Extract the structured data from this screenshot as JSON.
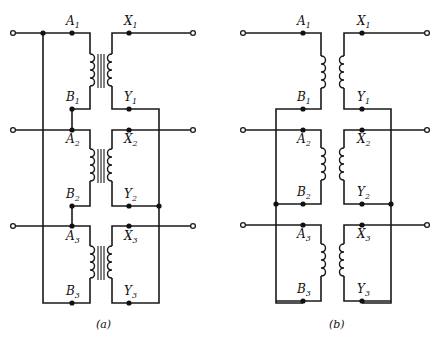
{
  "figure": {
    "panels": [
      {
        "id": "a",
        "caption": "(a)",
        "description": "Three single-phase transformers with iron cores; primaries and secondaries connected with cross bus wiring",
        "has_core": true,
        "rows": [
          {
            "primary_top": "A",
            "primary_bottom": "B",
            "secondary_top": "X",
            "secondary_bottom": "Y",
            "index": "1"
          },
          {
            "primary_top": "A",
            "primary_bottom": "B",
            "secondary_top": "X",
            "secondary_bottom": "Y",
            "index": "2"
          },
          {
            "primary_top": "A",
            "primary_bottom": "B",
            "secondary_top": "X",
            "secondary_bottom": "Y",
            "index": "3"
          }
        ]
      },
      {
        "id": "b",
        "caption": "(b)",
        "description": "Three transformer winding pairs without drawn core; primaries and secondaries connected via vertical buses",
        "has_core": false,
        "rows": [
          {
            "primary_top": "A",
            "primary_bottom": "B",
            "secondary_top": "X",
            "secondary_bottom": "Y",
            "index": "1"
          },
          {
            "primary_top": "A",
            "primary_bottom": "B",
            "secondary_top": "X",
            "secondary_bottom": "Y",
            "index": "2"
          },
          {
            "primary_top": "A",
            "primary_bottom": "B",
            "secondary_top": "X",
            "secondary_bottom": "Y",
            "index": "3"
          }
        ]
      }
    ],
    "colors": {
      "ink": "#1a1a1a",
      "background": "#ffffff"
    }
  },
  "labels": {
    "a": {
      "A1": "A",
      "A1s": "1",
      "X1": "X",
      "X1s": "1",
      "B1": "B",
      "B1s": "1",
      "Y1": "Y",
      "Y1s": "1",
      "A2": "A",
      "A2s": "2",
      "X2": "X",
      "X2s": "2",
      "B2": "B",
      "B2s": "2",
      "Y2": "Y",
      "Y2s": "2",
      "A3": "A",
      "A3s": "3",
      "X3": "X",
      "X3s": "3",
      "B3": "B",
      "B3s": "3",
      "Y3": "Y",
      "Y3s": "3",
      "caption": "(a)"
    },
    "b": {
      "A1": "A",
      "A1s": "1",
      "X1": "X",
      "X1s": "1",
      "B1": "B",
      "B1s": "1",
      "Y1": "Y",
      "Y1s": "1",
      "A2": "A",
      "A2s": "2",
      "X2": "X",
      "X2s": "2",
      "B2": "B",
      "B2s": "2",
      "Y2": "Y",
      "Y2s": "2",
      "A3": "A",
      "A3s": "3",
      "X3": "X",
      "X3s": "3",
      "B3": "B",
      "B3s": "3",
      "Y3": "Y",
      "Y3s": "3",
      "caption": "(b)"
    }
  }
}
